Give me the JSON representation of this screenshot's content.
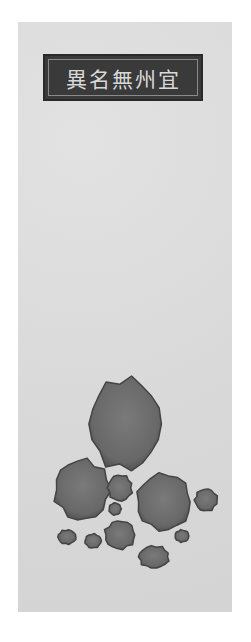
{
  "painting": {
    "title_label": "異名無州宜",
    "title_reading_rtl": "宜州無名異",
    "subject": "mineral stones (wumingyi) illustration",
    "colors": {
      "paper": "#dcdcdc",
      "label_bg": "#3a3a3a",
      "label_text": "#d8d8d8",
      "stone_fill": "#6e6e6e",
      "stone_edge": "#444444"
    },
    "stones": [
      {
        "cx": 125,
        "cy": 424,
        "rx": 35,
        "ry": 45
      },
      {
        "cx": 82,
        "cy": 490,
        "rx": 27,
        "ry": 30
      },
      {
        "cx": 164,
        "cy": 502,
        "rx": 27,
        "ry": 28
      },
      {
        "cx": 120,
        "cy": 488,
        "rx": 12,
        "ry": 13
      },
      {
        "cx": 206,
        "cy": 500,
        "rx": 11,
        "ry": 11
      },
      {
        "cx": 115,
        "cy": 509,
        "rx": 6,
        "ry": 6
      },
      {
        "cx": 120,
        "cy": 535,
        "rx": 15,
        "ry": 14
      },
      {
        "cx": 67,
        "cy": 537,
        "rx": 9,
        "ry": 7
      },
      {
        "cx": 93,
        "cy": 541,
        "rx": 8,
        "ry": 7
      },
      {
        "cx": 182,
        "cy": 536,
        "rx": 7,
        "ry": 6
      },
      {
        "cx": 154,
        "cy": 557,
        "rx": 15,
        "ry": 11
      }
    ]
  }
}
